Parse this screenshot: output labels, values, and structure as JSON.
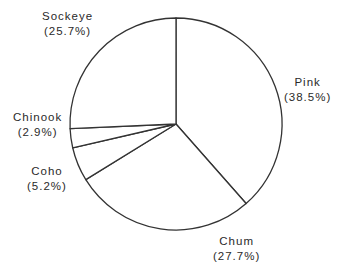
{
  "chart_data": {
    "type": "pie",
    "title": "",
    "start_angle_deg": 0,
    "direction": "clockwise",
    "categories": [
      "Pink",
      "Chum",
      "Coho",
      "Chinook",
      "Sockeye"
    ],
    "values": [
      38.5,
      27.7,
      5.2,
      2.9,
      25.7
    ],
    "unit": "%",
    "legend": "none (labels outside slices)",
    "colors": {
      "fill": "#ffffff",
      "stroke": "#333333"
    }
  },
  "labels": [
    {
      "name": "Pink",
      "pct": "(38.5%)"
    },
    {
      "name": "Chum",
      "pct": "(27.7%)"
    },
    {
      "name": "Coho",
      "pct": "(5.2%)"
    },
    {
      "name": "Chinook",
      "pct": "(2.9%)"
    },
    {
      "name": "Sockeye",
      "pct": "(25.7%)"
    }
  ]
}
